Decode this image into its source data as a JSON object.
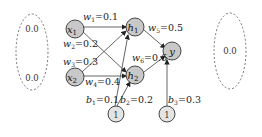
{
  "diagram": {
    "type": "neural-network",
    "left_group": {
      "values": [
        "0.0",
        "0.0"
      ]
    },
    "right_group": {
      "values": [
        "0.0"
      ]
    },
    "nodes": {
      "x1": {
        "base": "x",
        "sub": "1"
      },
      "x2": {
        "base": "x",
        "sub": "2"
      },
      "h1": {
        "base": "h",
        "sub": "1"
      },
      "h2": {
        "base": "h",
        "sub": "2"
      },
      "y": {
        "base": "y"
      },
      "bias1": {
        "label": "1"
      },
      "bias2": {
        "label": "1"
      }
    },
    "weights": [
      {
        "name": "w",
        "sub": "1",
        "value": "0.1"
      },
      {
        "name": "w",
        "sub": "2",
        "value": "0.2"
      },
      {
        "name": "w",
        "sub": "3",
        "value": "0.3"
      },
      {
        "name": "w",
        "sub": "4",
        "value": "0.4"
      },
      {
        "name": "w",
        "sub": "5",
        "value": "0.5"
      },
      {
        "name": "w",
        "sub": "6",
        "value": "0.6"
      }
    ],
    "biases": [
      {
        "name": "b",
        "sub": "1",
        "value": "0.1"
      },
      {
        "name": "b",
        "sub": "2",
        "value": "0.2"
      },
      {
        "name": "b",
        "sub": "3",
        "value": "0.3"
      }
    ],
    "colors": {
      "node_fill": "#c8c8c8",
      "bias_fill": "#e4e4e4",
      "stroke": "#333333",
      "edge": "#555555",
      "dashed": "#777777"
    }
  }
}
